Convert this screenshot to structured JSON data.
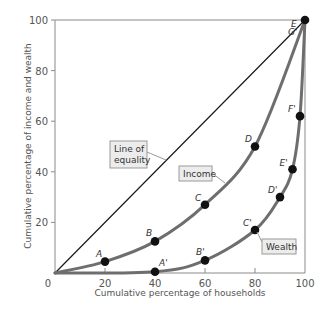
{
  "chart_data": {
    "type": "line",
    "title": "",
    "xlabel": "Cumulative percentage of households",
    "ylabel": "Cumulative percentage of income and wealth",
    "xlim": [
      0,
      100
    ],
    "ylim": [
      0,
      100
    ],
    "xticks": [
      0,
      20,
      40,
      60,
      80,
      100
    ],
    "yticks": [
      20,
      40,
      60,
      80,
      100
    ],
    "grid": false,
    "series": [
      {
        "name": "Line of equality",
        "points": [
          {
            "x": 0,
            "y": 0
          },
          {
            "x": 100,
            "y": 100
          }
        ]
      },
      {
        "name": "Income",
        "points": [
          {
            "label": "",
            "x": 0,
            "y": 0
          },
          {
            "label": "A",
            "x": 20,
            "y": 4.5
          },
          {
            "label": "B",
            "x": 40,
            "y": 12.5
          },
          {
            "label": "C",
            "x": 60,
            "y": 27
          },
          {
            "label": "D",
            "x": 80,
            "y": 50
          },
          {
            "label": "E",
            "x": 100,
            "y": 100
          }
        ]
      },
      {
        "name": "Wealth",
        "points": [
          {
            "label": "",
            "x": 0,
            "y": 0
          },
          {
            "label": "A'",
            "x": 40,
            "y": 0.5
          },
          {
            "label": "B'",
            "x": 60,
            "y": 5
          },
          {
            "label": "C'",
            "x": 80,
            "y": 17
          },
          {
            "label": "D'",
            "x": 90,
            "y": 30
          },
          {
            "label": "E'",
            "x": 95,
            "y": 41
          },
          {
            "label": "F'",
            "x": 98,
            "y": 62
          },
          {
            "label": "G'",
            "x": 100,
            "y": 100
          }
        ]
      }
    ],
    "annotations": [
      "Line of equality",
      "Income",
      "Wealth"
    ],
    "legend_position": "inline-boxes"
  },
  "colors": {
    "curve": "#6e6e6e",
    "equality_line": "#1a1a1a",
    "point": "#111111",
    "axis": "#8a8a8a",
    "box_fill": "#ececec",
    "box_border": "#9a9a9a"
  }
}
